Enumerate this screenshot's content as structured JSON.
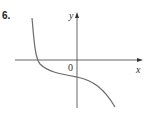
{
  "problem_number": "6.",
  "graph": {
    "x_label": "x",
    "y_label": "y",
    "origin_label": "0",
    "curve": "decreasing cubic-like curve: steep descent crossing x-axis left of origin, flattening near y-intercept below origin, then descending to bottom right",
    "colors": {
      "axes": "#555555",
      "curve": "#6b6b6b"
    }
  }
}
